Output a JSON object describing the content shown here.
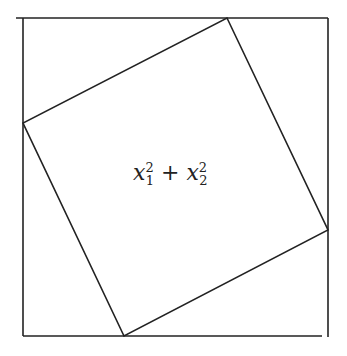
{
  "diagram": {
    "outer_square": {
      "x1": 23,
      "y1": 18,
      "x2": 328,
      "y2": 336
    },
    "inner_square": {
      "vertices": [
        [
          227,
          18
        ],
        [
          328,
          230
        ],
        [
          124,
          336
        ],
        [
          23,
          123
        ]
      ]
    },
    "label": {
      "var": "x",
      "term1_sub": "1",
      "term1_sup": "2",
      "op": "+",
      "term2_sub": "2",
      "term2_sup": "2"
    },
    "stroke_color": "#222222"
  }
}
